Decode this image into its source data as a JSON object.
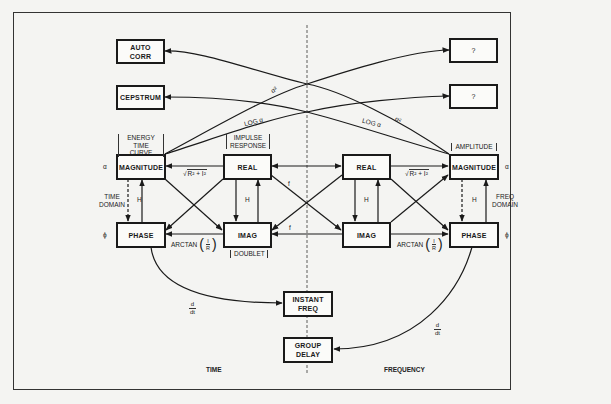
{
  "diagram": {
    "axes": {
      "time_label": "TIME",
      "frequency_label": "FREQUENCY"
    },
    "boxes": {
      "auto_corr": "AUTO\nCORR",
      "cepstrum": "CEPSTRUM",
      "unknown_1": "?",
      "unknown_2": "?",
      "time_magnitude": "MAGNITUDE",
      "time_real": "REAL",
      "time_phase": "PHASE",
      "time_imag": "IMAG",
      "freq_real": "REAL",
      "freq_magnitude": "MAGNITUDE",
      "freq_imag": "IMAG",
      "freq_phase": "PHASE",
      "instant_freq": "INSTANT\nFREQ",
      "group_delay": "GROUP\nDELAY"
    },
    "annotations": {
      "energy_time_curve": "ENERGY\nTIME CURVE",
      "impulse_response": "IMPULSE\nRESPONSE",
      "amplitude": "AMPLITUDE",
      "doublet": "DOUBLET",
      "time_domain": "TIME\nDOMAIN",
      "freq_domain": "FREQ\nDOMAIN",
      "alpha_symbol": "α",
      "phi_symbol": "ϕ"
    },
    "edge_labels": {
      "hilbert": "H",
      "fourier": "f",
      "sqrt_prefix": "√",
      "sqrt_expr": "R² + I²",
      "arctan": "ARCTAN",
      "arctan_num": "I",
      "arctan_den": "R",
      "log_alpha": "LOG α",
      "alpha_squared": "α²",
      "deriv_num": "d",
      "deriv_den": "dt"
    },
    "colors": {
      "line": "#1a1a1a",
      "background": "#f4f4f2",
      "box_fill": "#fbfbf9"
    }
  }
}
